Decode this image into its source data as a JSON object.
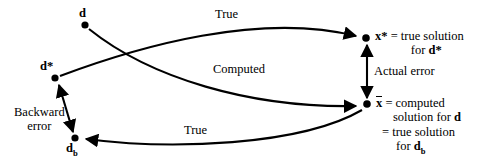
{
  "diagram": {
    "width": 478,
    "height": 165,
    "background_color": "#ffffff",
    "stroke_color": "#000000",
    "nodes": [
      {
        "id": "d",
        "label": "d",
        "x": 85,
        "y": 25
      },
      {
        "id": "dstar",
        "label": "d*",
        "x": 55,
        "y": 78
      },
      {
        "id": "db",
        "label": "d",
        "sub": "b",
        "x": 75,
        "y": 138
      },
      {
        "id": "xstar",
        "label": "x*",
        "x": 366,
        "y": 38
      },
      {
        "id": "xbar",
        "label": "x",
        "x": 367,
        "y": 104
      }
    ],
    "edge_labels": {
      "true_top": "True",
      "computed": "Computed",
      "true_bottom": "True",
      "actual_error": "Actual error",
      "backward_error_line1": "Backward",
      "backward_error_line2": "error"
    },
    "descriptions": {
      "xstar_line1": "= true solution",
      "xstar_line2": "for",
      "xstar_line2_bold": "d*",
      "xbar_line1": "= computed",
      "xbar_line2": "solution for",
      "xbar_line2_bold": "d",
      "xbar_line3": "= true solution",
      "xbar_line4": "for",
      "xbar_line4_bold": "d",
      "xbar_line4_sub": "b"
    },
    "node_text": {
      "d": "d",
      "dstar": "d*",
      "db_base": "d",
      "db_sub": "b",
      "xstar": "x*",
      "xbar": "x"
    }
  }
}
